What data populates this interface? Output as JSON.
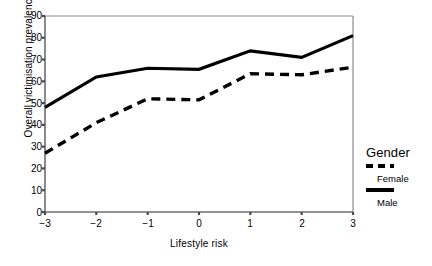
{
  "chart_data": {
    "type": "line",
    "title": "",
    "xlabel": "Lifestyle risk",
    "ylabel": "Overall victimisation prevalence",
    "x": [
      -3,
      -2,
      -1,
      0,
      1,
      2,
      3
    ],
    "xticklabels": [
      "−3",
      "−2",
      "−1",
      "0",
      "1",
      "2",
      "3"
    ],
    "yticks": [
      0,
      10,
      20,
      30,
      40,
      50,
      60,
      70,
      80,
      90
    ],
    "yticklabels": [
      "0",
      "10",
      "20",
      "30",
      "40",
      "50",
      "60",
      "70",
      "80",
      "90"
    ],
    "xlim": [
      -3,
      3
    ],
    "ylim": [
      0,
      90
    ],
    "grid": false,
    "legend_position": "right",
    "legend_title": "Gender",
    "series": [
      {
        "name": "Female",
        "style": "dashed",
        "color": "#000000",
        "values": [
          27,
          41,
          52,
          51.5,
          63.5,
          63,
          66.5
        ]
      },
      {
        "name": "Male",
        "style": "solid",
        "color": "#000000",
        "values": [
          48,
          62,
          66,
          65.5,
          74,
          71,
          81
        ]
      }
    ]
  },
  "axes": {
    "frame_color": "#8c8c8c",
    "axis_color": "#6e6e6e"
  }
}
